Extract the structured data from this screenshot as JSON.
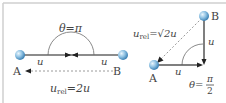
{
  "colors": {
    "frame": "#cfcfcf",
    "line": "#555555",
    "arrow": "#222222",
    "dashed": "#9a9a9a",
    "arc": "#8a8a8a",
    "sphere_light": "#dff0fb",
    "sphere_dark": "#4f93c4",
    "text": "#444444"
  },
  "left_panel": {
    "angle_label": "θ=π",
    "u_left": "u",
    "u_right": "u",
    "point_a": "A",
    "point_b": "B",
    "rel_var": "u",
    "rel_sub": "rel",
    "rel_value": "=2u"
  },
  "right_panel": {
    "point_a": "A",
    "point_b": "B",
    "u_horizontal": "u",
    "u_vertical": "u",
    "rel_var": "u",
    "rel_sub": "rel",
    "rel_value": "=√2u",
    "angle_prefix": "θ=",
    "angle_num": "π",
    "angle_den": "2"
  }
}
